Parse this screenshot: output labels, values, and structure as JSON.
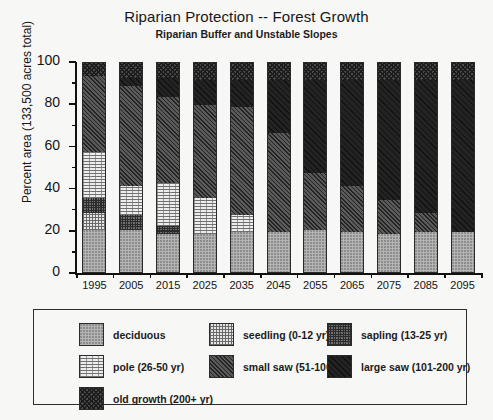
{
  "chart_data": {
    "type": "bar",
    "stacked": true,
    "title": "Riparian Protection -- Forest Growth",
    "subtitle": "Riparian Buffer and Unstable Slopes",
    "xlabel": "",
    "ylabel": "Percent area (133,500 acres total)",
    "ylim": [
      0,
      100
    ],
    "ytick_labels": [
      "0",
      "20",
      "40",
      "60",
      "80",
      "100"
    ],
    "ytick_values": [
      0,
      20,
      40,
      60,
      80,
      100
    ],
    "yminor_values": [
      10,
      30,
      50,
      70,
      90
    ],
    "grid": false,
    "legend_position": "below-plot",
    "categories": [
      "1995",
      "2005",
      "2015",
      "2025",
      "2035",
      "2045",
      "2055",
      "2065",
      "2075",
      "2085",
      "2095"
    ],
    "series": [
      {
        "name": "deciduous",
        "legend_label": "deciduous",
        "pattern": "p-deciduous",
        "color": "#b4b4b4",
        "values": [
          20,
          20,
          18,
          18,
          19,
          19,
          20,
          19,
          18,
          19,
          19
        ]
      },
      {
        "name": "seedling",
        "legend_label": "seedling (0-12 yr)",
        "pattern": "p-seedling",
        "color": "#e6e6e6",
        "values": [
          8,
          0,
          0,
          0,
          0,
          0,
          0,
          0,
          0,
          0,
          0
        ]
      },
      {
        "name": "sapling",
        "legend_label": "sapling (13-25 yr)",
        "pattern": "p-sapling",
        "color": "#6e6e6e",
        "values": [
          7,
          7,
          4,
          0,
          0,
          0,
          0,
          0,
          0,
          0,
          0
        ]
      },
      {
        "name": "pole",
        "legend_label": "pole (26-50 yr)",
        "pattern": "p-pole",
        "color": "#ededed",
        "values": [
          22,
          14,
          20,
          17,
          8,
          0,
          0,
          0,
          0,
          0,
          0
        ]
      },
      {
        "name": "small saw",
        "legend_label": "small saw (51-100 yr)",
        "pattern": "p-smallsaw",
        "color": "#5a5a5a",
        "values": [
          36,
          47,
          41,
          44,
          51,
          47,
          27,
          22,
          16,
          9,
          0
        ]
      },
      {
        "name": "large saw",
        "legend_label": "large saw (101-200 yr)",
        "pattern": "p-largesaw",
        "color": "#232323",
        "values": [
          0,
          4,
          9,
          12,
          13,
          25,
          44,
          50,
          57,
          63,
          72
        ]
      },
      {
        "name": "old growth",
        "legend_label": "old growth (200+ yr)",
        "pattern": "p-oldgrowth",
        "color": "#4a4a4a",
        "values": [
          7,
          8,
          8,
          9,
          9,
          9,
          9,
          9,
          9,
          9,
          9
        ]
      }
    ]
  },
  "legend": {
    "columns": [
      [
        "deciduous",
        "pole (26-50 yr)",
        "old growth (200+ yr)"
      ],
      [
        "seedling (0-12 yr)",
        "small saw (51-100 yr)"
      ],
      [
        "sapling (13-25 yr)",
        "large saw (101-200 yr)"
      ]
    ]
  }
}
